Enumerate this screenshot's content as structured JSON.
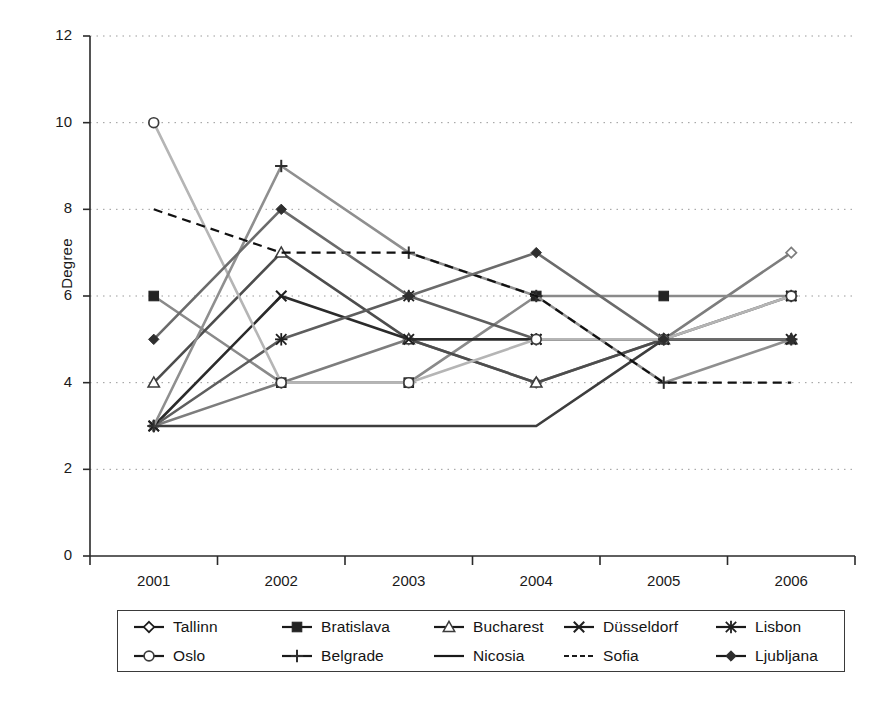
{
  "chart_data": {
    "type": "line",
    "title": "",
    "xlabel": "",
    "ylabel": "Degree",
    "categories": [
      "2001",
      "2002",
      "2003",
      "2004",
      "2005",
      "2006"
    ],
    "x": [
      2001,
      2002,
      2003,
      2004,
      2005,
      2006
    ],
    "ylim": [
      0,
      12
    ],
    "yticks": [
      0,
      2,
      4,
      6,
      8,
      10,
      12
    ],
    "grid": "horizontal-dotted",
    "legend_position": "bottom",
    "legend_columns": 5,
    "legend_rows": 2,
    "series": [
      {
        "name": "Tallinn",
        "marker": "open-diamond",
        "line": "solid",
        "color": "#7d7d7d",
        "values": [
          3,
          4,
          5,
          4,
          5,
          7
        ]
      },
      {
        "name": "Bratislava",
        "marker": "filled-square",
        "line": "solid",
        "color": "#8a8a8a",
        "values": [
          6,
          4,
          4,
          6,
          6,
          6
        ]
      },
      {
        "name": "Bucharest",
        "marker": "open-triangle",
        "line": "solid",
        "color": "#4d4d4d",
        "values": [
          4,
          7,
          5,
          4,
          5,
          5
        ]
      },
      {
        "name": "Düsseldorf",
        "marker": "x-cross",
        "line": "solid",
        "color": "#2b2b2b",
        "values": [
          3,
          6,
          5,
          5,
          5,
          5
        ]
      },
      {
        "name": "Lisbon",
        "marker": "asterisk",
        "line": "solid",
        "color": "#5e5e5e",
        "values": [
          3,
          5,
          6,
          5,
          5,
          6
        ]
      },
      {
        "name": "Oslo",
        "marker": "open-circle",
        "line": "solid",
        "color": "#b5b5b5",
        "values": [
          10,
          4,
          4,
          5,
          5,
          6
        ]
      },
      {
        "name": "Belgrade",
        "marker": "plus",
        "line": "solid",
        "color": "#8f8f8f",
        "values": [
          3,
          9,
          7,
          6,
          4,
          5
        ]
      },
      {
        "name": "Nicosia",
        "marker": "none",
        "line": "solid",
        "color": "#3d3d3d",
        "values": [
          3,
          3,
          3,
          3,
          5,
          5
        ]
      },
      {
        "name": "Sofia",
        "marker": "none",
        "line": "dashed",
        "color": "#111111",
        "values": [
          8,
          7,
          7,
          6,
          4,
          4
        ]
      },
      {
        "name": "Ljubljana",
        "marker": "filled-diamond",
        "line": "solid",
        "color": "#6b6b6b",
        "values": [
          5,
          8,
          6,
          7,
          5,
          5
        ]
      }
    ]
  },
  "axes": {
    "y_title": "Degree",
    "y_tick_labels": [
      "12",
      "10",
      "8",
      "6",
      "4",
      "2",
      "0"
    ],
    "x_tick_labels": [
      "2001",
      "2002",
      "2003",
      "2004",
      "2005",
      "2006"
    ]
  },
  "legend": {
    "rows": [
      [
        {
          "label": "Tallinn",
          "icon": "open-diamond-marker-icon"
        },
        {
          "label": "Bratislava",
          "icon": "filled-square-marker-icon"
        },
        {
          "label": "Bucharest",
          "icon": "open-triangle-marker-icon"
        },
        {
          "label": "Düsseldorf",
          "icon": "x-cross-marker-icon"
        },
        {
          "label": "Lisbon",
          "icon": "asterisk-marker-icon"
        }
      ],
      [
        {
          "label": "Oslo",
          "icon": "open-circle-marker-icon"
        },
        {
          "label": "Belgrade",
          "icon": "plus-marker-icon"
        },
        {
          "label": "Nicosia",
          "icon": "solid-line-icon"
        },
        {
          "label": "Sofia",
          "icon": "dashed-line-icon"
        },
        {
          "label": "Ljubljana",
          "icon": "filled-diamond-marker-icon"
        }
      ]
    ]
  }
}
